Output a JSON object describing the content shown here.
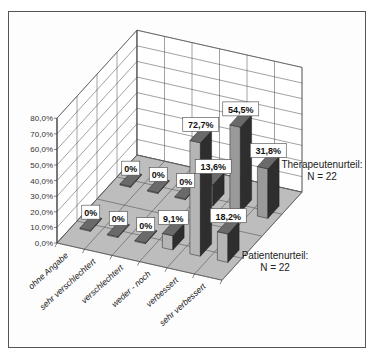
{
  "chart_data": {
    "type": "bar",
    "subtype": "3d-clustered-rows",
    "title": "",
    "xlabel": "",
    "ylabel": "",
    "ylim": [
      0,
      80
    ],
    "y_ticks": [
      "0,0%",
      "10,0%",
      "20,0%",
      "30,0%",
      "40,0%",
      "50,0%",
      "60,0%",
      "70,0%",
      "80,0%"
    ],
    "grid": true,
    "categories": [
      "ohne Angabe",
      "sehr verschlechtert",
      "verschlechtert",
      "weder - noch",
      "verbessert",
      "sehr verbessert"
    ],
    "series": [
      {
        "name": "Patientenurteil:",
        "n_label": "N = 22",
        "values": [
          0,
          0,
          0,
          9.1,
          72.7,
          18.2
        ],
        "labels": [
          "0%",
          "0%",
          "0%",
          "9,1%",
          "72,7%",
          "18,2%"
        ]
      },
      {
        "name": "Therapeutenurteil:",
        "n_label": "N = 22",
        "values": [
          0,
          0,
          0,
          13.6,
          54.5,
          31.8
        ],
        "labels": [
          "0%",
          "0%",
          "0%",
          "13,6%",
          "54,5%",
          "31,8%"
        ]
      }
    ],
    "legend_position": "right (series labels beside rows)"
  },
  "colors": {
    "frame": "#555555",
    "floor": "#bdbdbd",
    "grid": "#444444",
    "bar_front": "#9a9a9a",
    "bar_side": "#2e2e2e",
    "bar_top": "#6a6a6a",
    "front_series_front": "#b5b5b5",
    "label_box": "#ffffff"
  }
}
